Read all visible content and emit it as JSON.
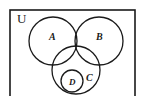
{
  "figure": {
    "type": "venn-diagram",
    "title": "",
    "background_color": "#ffffff",
    "stroke_color": "#1a1a1a",
    "label_color": "#1a1a1a"
  },
  "universe": {
    "label": "U",
    "shape": "rectangle",
    "x": 10,
    "y": 10,
    "width": 125,
    "height": 90,
    "label_x": 17,
    "label_y": 23,
    "font_size": 13
  },
  "sets": [
    {
      "name": "set-a",
      "label": "A",
      "cx": 53,
      "cy": 41,
      "r": 24,
      "label_x": 49,
      "label_y": 40,
      "font_size": 10
    },
    {
      "name": "set-b",
      "label": "B",
      "cx": 99,
      "cy": 41,
      "r": 24,
      "label_x": 96,
      "label_y": 40,
      "font_size": 10
    },
    {
      "name": "set-c",
      "label": "C",
      "cx": 76,
      "cy": 70,
      "r": 24,
      "label_x": 86,
      "label_y": 81,
      "font_size": 10
    },
    {
      "name": "set-d",
      "label": "D",
      "cx": 72,
      "cy": 81,
      "r": 11,
      "label_x": 69,
      "label_y": 85,
      "font_size": 9
    }
  ],
  "relations": {
    "description": "A, B and C mutually overlap; D is contained entirely within C"
  }
}
